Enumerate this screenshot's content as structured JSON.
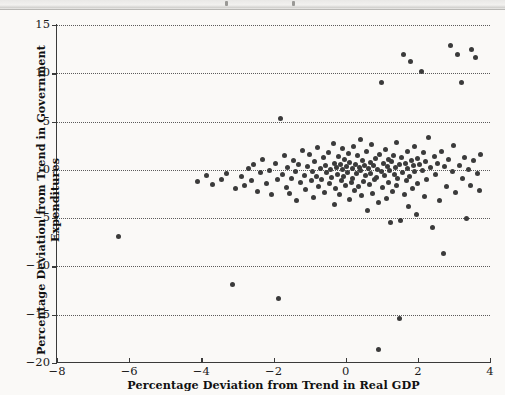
{
  "figure": {
    "background_color": "#faf9f7",
    "point_color": "#3b3b3b",
    "grid_color": "#5b5b5b"
  },
  "chart_data": {
    "type": "scatter",
    "title": "",
    "xlabel": "Percentage Deviation from Trend in Real GDP",
    "ylabel": "Percentage Deviation from Trend in Government Expenditures",
    "xlim": [
      -8,
      4
    ],
    "ylim": [
      -20,
      15
    ],
    "xticks": [
      -8,
      -6,
      -4,
      -2,
      0,
      2,
      4
    ],
    "xtick_labels": [
      "−8",
      "−6",
      "−4",
      "−2",
      "0",
      "2",
      "4"
    ],
    "yticks": [
      15,
      10,
      5,
      0,
      -5,
      -10,
      -15,
      -20
    ],
    "ytick_labels": [
      "15",
      "10",
      "5",
      "0",
      "−5",
      "−10",
      "−15",
      "−20"
    ],
    "grid": "horizontal-dotted",
    "legend": null,
    "marker": "filled-circle",
    "points": [
      [
        -6.3,
        -6.9
      ],
      [
        -4.1,
        -1.2
      ],
      [
        -3.85,
        -0.6
      ],
      [
        -3.7,
        -1.55
      ],
      [
        -3.45,
        -1.0
      ],
      [
        -3.3,
        -0.35
      ],
      [
        -3.15,
        -11.9
      ],
      [
        -3.05,
        -1.95
      ],
      [
        -2.9,
        -0.7
      ],
      [
        -2.8,
        -1.6
      ],
      [
        -2.7,
        0.1
      ],
      [
        -2.6,
        -1.1
      ],
      [
        -2.55,
        0.55
      ],
      [
        -2.45,
        -2.2
      ],
      [
        -2.35,
        -0.25
      ],
      [
        -2.3,
        1.1
      ],
      [
        -2.2,
        -1.45
      ],
      [
        -2.1,
        -0.1
      ],
      [
        -2.05,
        -2.6
      ],
      [
        -1.95,
        0.7
      ],
      [
        -1.9,
        -1.05
      ],
      [
        -1.85,
        -13.3
      ],
      [
        -1.8,
        5.3
      ],
      [
        -1.75,
        -0.45
      ],
      [
        -1.7,
        1.45
      ],
      [
        -1.65,
        -1.85
      ],
      [
        -1.6,
        0.25
      ],
      [
        -1.55,
        -2.4
      ],
      [
        -1.5,
        -0.9
      ],
      [
        -1.45,
        1.0
      ],
      [
        -1.4,
        -0.2
      ],
      [
        -1.35,
        -3.2
      ],
      [
        -1.3,
        0.6
      ],
      [
        -1.25,
        -1.3
      ],
      [
        -1.2,
        2.05
      ],
      [
        -1.15,
        -0.55
      ],
      [
        -1.1,
        -2.05
      ],
      [
        -1.05,
        0.35
      ],
      [
        -1.0,
        1.6
      ],
      [
        -0.95,
        -1.1
      ],
      [
        -0.92,
        -0.15
      ],
      [
        -0.88,
        -2.9
      ],
      [
        -0.85,
        0.9
      ],
      [
        -0.8,
        -0.65
      ],
      [
        -0.78,
        2.35
      ],
      [
        -0.74,
        -1.7
      ],
      [
        -0.7,
        0.15
      ],
      [
        -0.66,
        -0.95
      ],
      [
        -0.62,
        1.25
      ],
      [
        -0.58,
        -2.3
      ],
      [
        -0.55,
        0.45
      ],
      [
        -0.52,
        -0.3
      ],
      [
        -0.48,
        1.8
      ],
      [
        -0.45,
        -1.4
      ],
      [
        -0.42,
        0.0
      ],
      [
        -0.38,
        -0.8
      ],
      [
        -0.35,
        2.7
      ],
      [
        -0.32,
        -3.6
      ],
      [
        -0.3,
        0.7
      ],
      [
        -0.28,
        -1.95
      ],
      [
        -0.25,
        0.2
      ],
      [
        -0.22,
        -0.5
      ],
      [
        -0.2,
        1.35
      ],
      [
        -0.18,
        -2.55
      ],
      [
        -0.15,
        0.55
      ],
      [
        -0.12,
        -1.15
      ],
      [
        -0.1,
        0.05
      ],
      [
        -0.08,
        2.2
      ],
      [
        -0.05,
        -0.7
      ],
      [
        -0.02,
        1.05
      ],
      [
        0.0,
        -1.6
      ],
      [
        0.02,
        0.35
      ],
      [
        0.05,
        -0.25
      ],
      [
        0.08,
        1.7
      ],
      [
        0.1,
        -3.05
      ],
      [
        0.12,
        0.8
      ],
      [
        0.15,
        -1.35
      ],
      [
        0.18,
        0.1
      ],
      [
        0.2,
        -0.9
      ],
      [
        0.22,
        2.45
      ],
      [
        0.25,
        -2.15
      ],
      [
        0.28,
        0.6
      ],
      [
        0.3,
        -0.4
      ],
      [
        0.32,
        1.5
      ],
      [
        0.35,
        -1.75
      ],
      [
        0.38,
        0.25
      ],
      [
        0.4,
        -0.05
      ],
      [
        0.42,
        3.1
      ],
      [
        0.45,
        -2.7
      ],
      [
        0.48,
        0.95
      ],
      [
        0.5,
        -1.2
      ],
      [
        0.52,
        0.4
      ],
      [
        0.55,
        -0.6
      ],
      [
        0.58,
        1.9
      ],
      [
        0.6,
        -4.25
      ],
      [
        0.62,
        0.15
      ],
      [
        0.65,
        -1.5
      ],
      [
        0.68,
        0.75
      ],
      [
        0.7,
        -0.35
      ],
      [
        0.72,
        2.6
      ],
      [
        0.75,
        -2.4
      ],
      [
        0.78,
        0.5
      ],
      [
        0.8,
        -1.05
      ],
      [
        0.82,
        1.2
      ],
      [
        0.85,
        -0.75
      ],
      [
        0.88,
        0.05
      ],
      [
        0.9,
        -18.6
      ],
      [
        0.92,
        -3.4
      ],
      [
        0.95,
        1.6
      ],
      [
        0.98,
        -0.2
      ],
      [
        1.0,
        9.0
      ],
      [
        1.02,
        -1.85
      ],
      [
        1.05,
        0.65
      ],
      [
        1.08,
        -0.55
      ],
      [
        1.1,
        2.15
      ],
      [
        1.12,
        -2.95
      ],
      [
        1.15,
        0.3
      ],
      [
        1.18,
        -1.3
      ],
      [
        1.2,
        1.05
      ],
      [
        1.22,
        -0.1
      ],
      [
        1.25,
        -5.4
      ],
      [
        1.28,
        0.85
      ],
      [
        1.3,
        -2.2
      ],
      [
        1.32,
        1.45
      ],
      [
        1.35,
        -0.45
      ],
      [
        1.38,
        0.2
      ],
      [
        1.4,
        -1.6
      ],
      [
        1.42,
        2.85
      ],
      [
        1.45,
        -0.85
      ],
      [
        1.48,
        0.55
      ],
      [
        1.5,
        -15.4
      ],
      [
        1.52,
        -5.2
      ],
      [
        1.55,
        1.25
      ],
      [
        1.58,
        -0.3
      ],
      [
        1.6,
        11.95
      ],
      [
        1.62,
        -2.5
      ],
      [
        1.65,
        0.7
      ],
      [
        1.68,
        -1.15
      ],
      [
        1.7,
        1.95
      ],
      [
        1.72,
        0.1
      ],
      [
        1.75,
        -3.8
      ],
      [
        1.78,
        -0.65
      ],
      [
        1.8,
        11.25
      ],
      [
        1.82,
        0.95
      ],
      [
        1.85,
        -1.95
      ],
      [
        1.88,
        0.4
      ],
      [
        1.9,
        2.4
      ],
      [
        1.92,
        -0.2
      ],
      [
        1.95,
        -4.6
      ],
      [
        1.98,
        1.15
      ],
      [
        2.0,
        -1.4
      ],
      [
        2.05,
        0.6
      ],
      [
        2.1,
        10.2
      ],
      [
        2.12,
        -0.05
      ],
      [
        2.15,
        1.75
      ],
      [
        2.18,
        -2.8
      ],
      [
        2.2,
        0.85
      ],
      [
        2.25,
        -1.0
      ],
      [
        2.3,
        3.35
      ],
      [
        2.35,
        0.25
      ],
      [
        2.4,
        -5.95
      ],
      [
        2.45,
        1.4
      ],
      [
        2.5,
        -0.5
      ],
      [
        2.55,
        0.7
      ],
      [
        2.6,
        -3.2
      ],
      [
        2.65,
        1.9
      ],
      [
        2.7,
        -8.7
      ],
      [
        2.75,
        0.35
      ],
      [
        2.8,
        -1.7
      ],
      [
        2.85,
        1.1
      ],
      [
        2.9,
        12.9
      ],
      [
        2.95,
        -0.15
      ],
      [
        3.0,
        2.55
      ],
      [
        3.05,
        -2.3
      ],
      [
        3.1,
        11.95
      ],
      [
        3.15,
        0.5
      ],
      [
        3.2,
        9.05
      ],
      [
        3.25,
        -0.9
      ],
      [
        3.3,
        1.3
      ],
      [
        3.35,
        -5.0
      ],
      [
        3.4,
        0.05
      ],
      [
        3.45,
        -1.6
      ],
      [
        3.5,
        12.5
      ],
      [
        3.55,
        0.95
      ],
      [
        3.6,
        11.6
      ],
      [
        3.65,
        -0.35
      ],
      [
        3.7,
        -2.1
      ],
      [
        3.75,
        1.55
      ]
    ]
  }
}
